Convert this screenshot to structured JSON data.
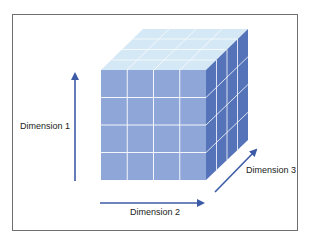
{
  "diagram": {
    "type": "data-cube",
    "grid": {
      "rows": 4,
      "columns": 4,
      "depth": 4
    },
    "colors": {
      "front_face": "#8fa6d9",
      "side_face": "#5573b8",
      "top_face": "#d5e8f5",
      "grid_lines": "#ffffff",
      "arrows": "#3c5aa6",
      "border": "#6f6f6f",
      "text": "#222222"
    },
    "axes": [
      {
        "label": "Dimension 1",
        "direction": "vertical"
      },
      {
        "label": "Dimension 2",
        "direction": "horizontal"
      },
      {
        "label": "Dimension 3",
        "direction": "depth"
      }
    ]
  }
}
